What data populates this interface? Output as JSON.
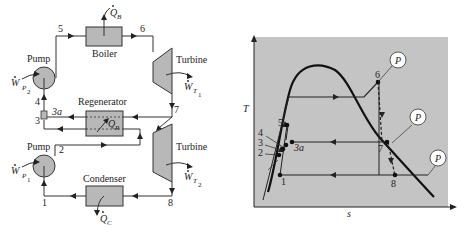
{
  "schematic": {
    "components": {
      "boiler": "Boiler",
      "turbine_hp": "Turbine",
      "turbine_lp": "Turbine",
      "regenerator": "Regenerator",
      "condenser": "Condenser",
      "pump_upper": "Pump",
      "pump_lower": "Pump"
    },
    "heat_work": {
      "qb": "Q",
      "qb_sub": "B",
      "qr": "Q",
      "qr_sub": "R",
      "qc": "Q",
      "qc_sub": "C",
      "wt1": "W",
      "wt1_sub": "T",
      "wt1_subsub": "1",
      "wt2": "W",
      "wt2_sub": "T",
      "wt2_subsub": "2",
      "wp1": "W",
      "wp1_sub": "P",
      "wp1_subsub": "1",
      "wp2": "W",
      "wp2_sub": "P",
      "wp2_subsub": "2"
    },
    "state_points": {
      "s1": "1",
      "s2": "2",
      "s3": "3",
      "s3a": "3a",
      "s4": "4",
      "s5": "5",
      "s6": "6",
      "s7": "7",
      "s8": "8"
    }
  },
  "ts_diagram": {
    "y_axis_label": "T",
    "x_axis_label": "s",
    "isobar_label": "P",
    "state_points": {
      "s1": "1",
      "s2": "2",
      "s3": "3",
      "s3a": "3a",
      "s4": "4",
      "s5": "5",
      "s6": "6",
      "s7": "7",
      "s8": "8"
    },
    "background_color": "#c4c4c4"
  }
}
